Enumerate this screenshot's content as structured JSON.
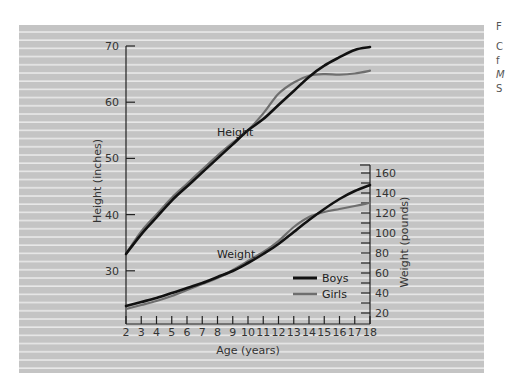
{
  "colors": {
    "background": "#c4c4c4",
    "stripe": "#e8e8e8",
    "boys": "#111111",
    "girls": "#6e6e6e",
    "axis": "#222222"
  },
  "side_caption_fragments": [
    "F",
    "C",
    "f",
    "M",
    "S"
  ],
  "chart_data": {
    "type": "line",
    "title": "",
    "xlabel": "Age (years)",
    "x": [
      2,
      3,
      4,
      5,
      6,
      7,
      8,
      9,
      10,
      11,
      12,
      13,
      14,
      15,
      16,
      17,
      18
    ],
    "xlim": [
      2,
      18
    ],
    "x_ticks": [
      "2",
      "3",
      "4",
      "5",
      "6",
      "7",
      "8",
      "9",
      "10",
      "11",
      "12",
      "13",
      "14",
      "15",
      "16",
      "17",
      "18"
    ],
    "left_axis": {
      "label": "Height (inches)",
      "ylim": [
        20,
        70
      ],
      "ticks": [
        "30",
        "40",
        "50",
        "60",
        "70"
      ]
    },
    "right_axis": {
      "label": "Weight (pounds)",
      "ylim": [
        10,
        170
      ],
      "ticks": [
        "20",
        "40",
        "60",
        "80",
        "100",
        "120",
        "140",
        "160"
      ]
    },
    "annotations": [
      "Height",
      "Weight"
    ],
    "legend": {
      "position": "lower-right (inside)",
      "entries": [
        "Boys",
        "Girls"
      ]
    },
    "grid": false,
    "series": [
      {
        "name": "Boys",
        "measure": "Height",
        "axis": "left",
        "values": [
          33,
          36.5,
          39.5,
          42.5,
          45,
          47.5,
          50,
          52.5,
          55,
          57,
          59.5,
          62,
          64.5,
          66.5,
          68,
          69.3,
          69.8
        ]
      },
      {
        "name": "Girls",
        "measure": "Height",
        "axis": "left",
        "values": [
          33,
          37,
          40,
          43,
          45.5,
          48,
          50.5,
          52.8,
          55,
          58,
          61.5,
          63.5,
          64.7,
          65,
          64.9,
          65.1,
          65.6
        ]
      },
      {
        "name": "Boys",
        "measure": "Weight",
        "axis": "right",
        "values": [
          27,
          31,
          35,
          40,
          45,
          50,
          56,
          62,
          70,
          79,
          89,
          101,
          113,
          124,
          134,
          142,
          148
        ]
      },
      {
        "name": "Girls",
        "measure": "Weight",
        "axis": "right",
        "values": [
          24,
          28,
          32,
          37,
          43,
          49,
          55,
          63,
          72,
          81,
          92,
          106,
          116,
          121,
          124,
          127,
          130
        ]
      }
    ]
  }
}
